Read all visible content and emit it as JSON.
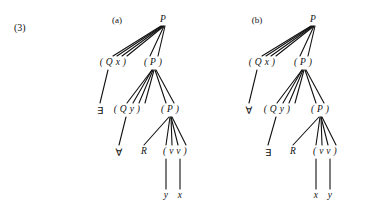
{
  "example_number": "(3)",
  "trees": [
    {
      "caption": "(a)",
      "caption_pos": {
        "x": 117,
        "y": 20
      },
      "nodes": [
        {
          "name": "root-p",
          "label": "P",
          "italic": true,
          "x": 163,
          "y": 20
        },
        {
          "name": "qx-phrase",
          "label": "( Q x )",
          "italic": true,
          "x": 113,
          "y": 63
        },
        {
          "name": "p-phrase-level2",
          "label": "( P )",
          "italic": true,
          "x": 153,
          "y": 63
        },
        {
          "name": "quantifier-exists",
          "label": "∃",
          "italic": false,
          "x": 100,
          "y": 110
        },
        {
          "name": "qy-phrase",
          "label": "( Q y )",
          "italic": true,
          "x": 127,
          "y": 110
        },
        {
          "name": "p-phrase-level3",
          "label": "( P )",
          "italic": true,
          "x": 170,
          "y": 110
        },
        {
          "name": "quantifier-forall",
          "label": "∀",
          "italic": false,
          "x": 119,
          "y": 152
        },
        {
          "name": "relation-r",
          "label": "R",
          "italic": true,
          "x": 144,
          "y": 152
        },
        {
          "name": "vv-phrase",
          "label": "( v v )",
          "italic": true,
          "x": 175,
          "y": 152
        },
        {
          "name": "leaf-y",
          "label": "y",
          "italic": true,
          "x": 166,
          "y": 196
        },
        {
          "name": "leaf-x",
          "label": "x",
          "italic": true,
          "x": 180,
          "y": 196
        }
      ],
      "edges": [
        {
          "from": [
            161,
            26
          ],
          "to": [
            113,
            56
          ]
        },
        {
          "from": [
            162,
            26
          ],
          "to": [
            117,
            56
          ]
        },
        {
          "from": [
            163,
            26
          ],
          "to": [
            122,
            56
          ]
        },
        {
          "from": [
            164,
            26
          ],
          "to": [
            127,
            56
          ]
        },
        {
          "from": [
            164,
            26
          ],
          "to": [
            150,
            56
          ]
        },
        {
          "from": [
            165,
            26
          ],
          "to": [
            158,
            56
          ]
        },
        {
          "from": [
            108,
            70
          ],
          "to": [
            100,
            103
          ]
        },
        {
          "from": [
            152,
            70
          ],
          "to": [
            127,
            103
          ]
        },
        {
          "from": [
            152,
            70
          ],
          "to": [
            133,
            103
          ]
        },
        {
          "from": [
            153,
            70
          ],
          "to": [
            139,
            103
          ]
        },
        {
          "from": [
            154,
            70
          ],
          "to": [
            145,
            103
          ]
        },
        {
          "from": [
            155,
            70
          ],
          "to": [
            166,
            103
          ]
        },
        {
          "from": [
            156,
            70
          ],
          "to": [
            174,
            103
          ]
        },
        {
          "from": [
            126,
            117
          ],
          "to": [
            119,
            145
          ]
        },
        {
          "from": [
            169,
            117
          ],
          "to": [
            144,
            145
          ]
        },
        {
          "from": [
            170,
            117
          ],
          "to": [
            166,
            145
          ]
        },
        {
          "from": [
            171,
            117
          ],
          "to": [
            172,
            145
          ]
        },
        {
          "from": [
            171,
            117
          ],
          "to": [
            178,
            145
          ]
        },
        {
          "from": [
            172,
            117
          ],
          "to": [
            186,
            145
          ]
        },
        {
          "from": [
            166,
            159
          ],
          "to": [
            166,
            189
          ]
        },
        {
          "from": [
            180,
            159
          ],
          "to": [
            180,
            189
          ]
        }
      ]
    },
    {
      "caption": "(b)",
      "caption_pos": {
        "x": 257,
        "y": 20
      },
      "nodes": [
        {
          "name": "root-p",
          "label": "P",
          "italic": true,
          "x": 313,
          "y": 20
        },
        {
          "name": "qx-phrase",
          "label": "( Q x )",
          "italic": true,
          "x": 262,
          "y": 63
        },
        {
          "name": "p-phrase-level2",
          "label": "( P )",
          "italic": true,
          "x": 303,
          "y": 63
        },
        {
          "name": "quantifier-forall",
          "label": "∀",
          "italic": false,
          "x": 249,
          "y": 110
        },
        {
          "name": "qy-phrase",
          "label": "( Q y )",
          "italic": true,
          "x": 277,
          "y": 110
        },
        {
          "name": "p-phrase-level3",
          "label": "( P )",
          "italic": true,
          "x": 320,
          "y": 110
        },
        {
          "name": "quantifier-exists",
          "label": "∃",
          "italic": false,
          "x": 268,
          "y": 152
        },
        {
          "name": "relation-r",
          "label": "R",
          "italic": true,
          "x": 293,
          "y": 152
        },
        {
          "name": "vv-phrase",
          "label": "( v v )",
          "italic": true,
          "x": 325,
          "y": 152
        },
        {
          "name": "leaf-x",
          "label": "x",
          "italic": true,
          "x": 316,
          "y": 196
        },
        {
          "name": "leaf-y",
          "label": "y",
          "italic": true,
          "x": 330,
          "y": 196
        }
      ],
      "edges": [
        {
          "from": [
            311,
            26
          ],
          "to": [
            262,
            56
          ]
        },
        {
          "from": [
            312,
            26
          ],
          "to": [
            266,
            56
          ]
        },
        {
          "from": [
            313,
            26
          ],
          "to": [
            271,
            56
          ]
        },
        {
          "from": [
            314,
            26
          ],
          "to": [
            276,
            56
          ]
        },
        {
          "from": [
            314,
            26
          ],
          "to": [
            300,
            56
          ]
        },
        {
          "from": [
            315,
            26
          ],
          "to": [
            308,
            56
          ]
        },
        {
          "from": [
            257,
            70
          ],
          "to": [
            249,
            103
          ]
        },
        {
          "from": [
            302,
            70
          ],
          "to": [
            277,
            103
          ]
        },
        {
          "from": [
            302,
            70
          ],
          "to": [
            283,
            103
          ]
        },
        {
          "from": [
            303,
            70
          ],
          "to": [
            289,
            103
          ]
        },
        {
          "from": [
            304,
            70
          ],
          "to": [
            295,
            103
          ]
        },
        {
          "from": [
            305,
            70
          ],
          "to": [
            316,
            103
          ]
        },
        {
          "from": [
            306,
            70
          ],
          "to": [
            324,
            103
          ]
        },
        {
          "from": [
            276,
            117
          ],
          "to": [
            268,
            145
          ]
        },
        {
          "from": [
            319,
            117
          ],
          "to": [
            293,
            145
          ]
        },
        {
          "from": [
            320,
            117
          ],
          "to": [
            316,
            145
          ]
        },
        {
          "from": [
            321,
            117
          ],
          "to": [
            322,
            145
          ]
        },
        {
          "from": [
            321,
            117
          ],
          "to": [
            328,
            145
          ]
        },
        {
          "from": [
            322,
            117
          ],
          "to": [
            336,
            145
          ]
        },
        {
          "from": [
            316,
            159
          ],
          "to": [
            316,
            189
          ]
        },
        {
          "from": [
            330,
            159
          ],
          "to": [
            330,
            189
          ]
        }
      ]
    }
  ],
  "colors": {
    "ink": "#111111",
    "background": "#ffffff"
  }
}
